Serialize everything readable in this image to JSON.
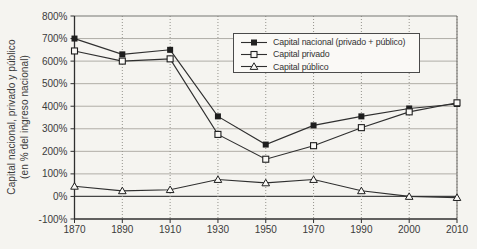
{
  "figure": {
    "background": "#f5f4f0",
    "ink_color": "#2f2f2f",
    "grid_color": "#b0aea7",
    "frame_color": "#777672",
    "text_color": "#3b3b3b"
  },
  "y_axis": {
    "title_line1": "Capital nacional, privado y público",
    "title_line2": "(en % del ingreso nacional)",
    "tick_labels": [
      "800%",
      "700%",
      "600%",
      "500%",
      "400%",
      "300%",
      "200%",
      "100%",
      "0%",
      "-100%"
    ]
  },
  "x_axis": {
    "tick_labels": [
      "1870",
      "1890",
      "1910",
      "1930",
      "1950",
      "1970",
      "1990",
      "2000",
      "2010"
    ]
  },
  "legend": {
    "items": [
      {
        "label": "Capital nacional (privado + público)",
        "marker": "filled-square"
      },
      {
        "label": "Capital privado",
        "marker": "open-square"
      },
      {
        "label": "Capital público",
        "marker": "open-triangle"
      }
    ]
  },
  "chart_data": {
    "type": "line",
    "categories": [
      1870,
      1890,
      1910,
      1930,
      1950,
      1970,
      1990,
      2000,
      2010
    ],
    "series": [
      {
        "name": "Capital nacional (privado + público)",
        "marker": "filled-square",
        "values": [
          700,
          630,
          650,
          355,
          230,
          315,
          355,
          390,
          410
        ]
      },
      {
        "name": "Capital privado",
        "marker": "open-square",
        "values": [
          645,
          600,
          610,
          275,
          165,
          225,
          305,
          375,
          415
        ]
      },
      {
        "name": "Capital público",
        "marker": "open-triangle",
        "values": [
          45,
          25,
          30,
          75,
          60,
          75,
          25,
          0,
          -5
        ]
      }
    ],
    "title": "",
    "xlabel": "",
    "ylabel": "Capital nacional, privado y público (en % del ingreso nacional)",
    "ylim": [
      -100,
      800
    ],
    "y_step": 100,
    "grid": true,
    "legend_position": "upper right inside plot"
  }
}
